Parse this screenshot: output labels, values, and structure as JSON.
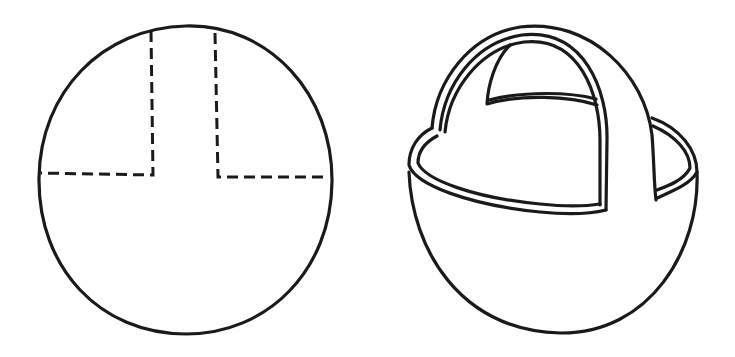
{
  "figure": {
    "panels": [
      {
        "id": "flat-template",
        "description": "Circle cut pattern with dashed fold/cut lines forming a central handle strip"
      },
      {
        "id": "assembled-basket",
        "description": "Folded paper basket with arched handle"
      }
    ],
    "colors": {
      "ink": "#1a1a1a",
      "background": "#ffffff"
    }
  }
}
